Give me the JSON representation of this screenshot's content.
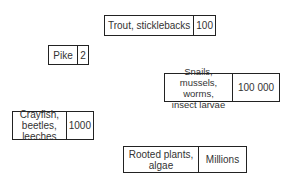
{
  "diagram": {
    "type": "ecological pyramid of numbers (food chain levels)",
    "nodes": [
      {
        "id": "trout",
        "label": "Trout, sticklebacks",
        "count": "100"
      },
      {
        "id": "pike",
        "label": "Pike",
        "count": "2"
      },
      {
        "id": "snails",
        "label": "Snails, mussels, worms,\ninsect larvae",
        "count": "100 000"
      },
      {
        "id": "crayfish",
        "label": "Crayfish, beetles,\nleeches",
        "count": "1000"
      },
      {
        "id": "plants",
        "label": "Rooted plants,\nalgae",
        "count": "Millions"
      }
    ]
  }
}
